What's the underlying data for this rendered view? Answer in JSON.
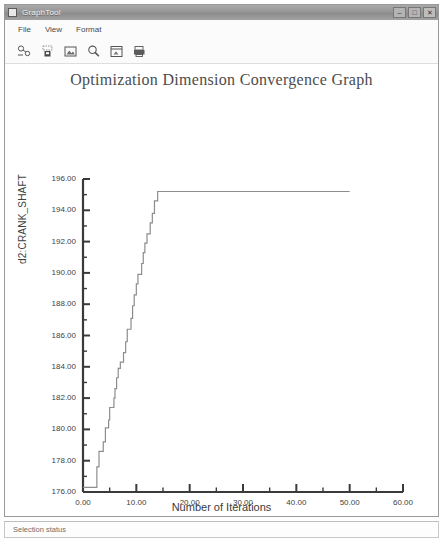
{
  "window": {
    "title": "GraphTool",
    "app_icon": "window-icon",
    "controls": [
      {
        "name": "minimize",
        "glyph": "–"
      },
      {
        "name": "maximize",
        "glyph": "□"
      },
      {
        "name": "close",
        "glyph": "✕"
      }
    ]
  },
  "menu": {
    "items": [
      {
        "label": "File"
      },
      {
        "label": "View"
      },
      {
        "label": "Format"
      }
    ]
  },
  "toolbar": {
    "items": [
      {
        "icon": "open-graph-icon",
        "label": "Open Graph"
      },
      {
        "icon": "save-graph-icon",
        "label": "Save Graph"
      },
      {
        "icon": "picture-icon",
        "label": "Export Image"
      },
      {
        "icon": "zoom-icon",
        "label": "Zoom"
      },
      {
        "icon": "fit-window-icon",
        "label": "Fit To Window"
      },
      {
        "icon": "print-icon",
        "label": "Print"
      }
    ]
  },
  "status": {
    "text": "Selection status"
  },
  "chart_data": {
    "type": "line",
    "title": "Optimization Dimension Convergence Graph",
    "xlabel": "Number of Iterations",
    "ylabel": "d2:CRANK_SHAFT",
    "xlim": [
      0.0,
      60.0
    ],
    "ylim": [
      176.0,
      196.0
    ],
    "xticks": [
      0.0,
      10.0,
      20.0,
      30.0,
      40.0,
      50.0,
      60.0
    ],
    "xtick_labels": [
      "0.00",
      "10.00",
      "20.00",
      "30.00",
      "40.00",
      "50.00",
      "60.00"
    ],
    "x_minor_tick_step": 5.0,
    "yticks": [
      176.0,
      178.0,
      180.0,
      182.0,
      184.0,
      186.0,
      188.0,
      190.0,
      192.0,
      194.0,
      196.0
    ],
    "ytick_labels": [
      "176.00",
      "178.00",
      "180.00",
      "182.00",
      "184.00",
      "186.00",
      "188.00",
      "190.00",
      "192.00",
      "194.00",
      "196.00"
    ],
    "y_minor_tick_step": 1.0,
    "grid": false,
    "legend_position": "bottom",
    "legend": [
      "Optimization Dimension Convergence Graph"
    ],
    "line_color": "#8d8d8d",
    "series": [
      {
        "name": "Optimization Dimension Convergence Graph",
        "x": [
          0.0,
          1.0,
          2.0,
          2.6,
          3.0,
          3.4,
          3.8,
          4.2,
          4.4,
          4.8,
          5.0,
          5.4,
          5.8,
          6.0,
          6.3,
          6.6,
          7.0,
          7.3,
          7.6,
          8.0,
          8.3,
          8.6,
          9.0,
          9.3,
          9.6,
          10.0,
          10.3,
          10.6,
          11.0,
          11.3,
          11.6,
          12.0,
          12.3,
          12.6,
          13.0,
          13.4,
          14.0,
          50.0
        ],
        "y": [
          176.3,
          176.3,
          176.3,
          177.6,
          178.6,
          178.6,
          179.2,
          180.1,
          180.1,
          180.6,
          181.4,
          181.4,
          182.0,
          182.6,
          183.3,
          183.9,
          184.3,
          184.3,
          184.9,
          185.6,
          186.4,
          186.4,
          187.1,
          187.9,
          188.6,
          189.3,
          189.9,
          189.9,
          190.6,
          191.3,
          191.9,
          192.5,
          192.5,
          193.2,
          193.8,
          194.6,
          195.2,
          195.2
        ]
      }
    ]
  },
  "plot_geometry": {
    "left": 78,
    "right": 398,
    "top": 115,
    "bottom": 428
  }
}
